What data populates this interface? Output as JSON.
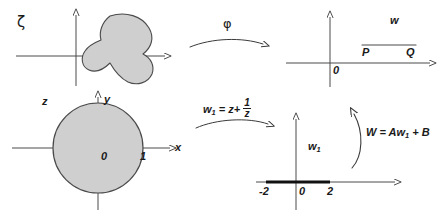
{
  "figure": {
    "width": 444,
    "height": 217,
    "background": "#ffffff",
    "ink": "#3a3a3a",
    "text_color": "#1a1a1a",
    "fill_gray": "#cfcfcf"
  },
  "panels": {
    "zeta_plane": {
      "plane_label": "ζ",
      "region_name": "blob-region",
      "origin": {
        "x": 76,
        "y": 56
      },
      "x_axis": {
        "x1": 16,
        "x2": 168,
        "y": 56
      },
      "y_axis": {
        "x": 76,
        "y1": 14,
        "y2": 88
      }
    },
    "w_plane": {
      "plane_label": "w",
      "origin_label": "0",
      "point_p_label": "P",
      "point_q_label": "Q",
      "segment": {
        "x1": 362,
        "x2": 416,
        "y": 45
      },
      "origin": {
        "x": 330,
        "y": 63
      },
      "x_axis": {
        "x1": 286,
        "x2": 432,
        "y": 63
      },
      "y_axis": {
        "x": 330,
        "y1": 16,
        "y2": 88
      }
    },
    "z_plane": {
      "plane_label": "z",
      "x_axis_label": "x",
      "y_axis_label": "y",
      "origin_label": "0",
      "unit_label": "1",
      "circle": {
        "cx": 98,
        "cy": 148,
        "r": 45
      },
      "origin": {
        "x": 98,
        "y": 148
      },
      "x_axis": {
        "x1": 12,
        "x2": 172,
        "y": 148
      },
      "y_axis": {
        "x": 98,
        "y1": 96,
        "y2": 212
      }
    },
    "w1_plane": {
      "plane_label": "w₁",
      "plane_label_base": "w",
      "plane_label_sub": "1",
      "origin_label": "0",
      "left_tick_label": "-2",
      "right_tick_label": "2",
      "cut_segment": {
        "x1": 266,
        "x2": 330,
        "y": 182
      },
      "origin": {
        "x": 296,
        "y": 182
      },
      "x_axis": {
        "x1": 256,
        "x2": 398,
        "y": 182
      },
      "y_axis": {
        "x": 296,
        "y1": 118,
        "y2": 212
      }
    }
  },
  "maps": {
    "phi": {
      "label": "φ",
      "arrow": "curved-right"
    },
    "joukowski": {
      "label_parts": {
        "lhs": "w",
        "lhs_sub": "1",
        "eq": "=",
        "rhs_first": "z",
        "plus": "+",
        "frac_num": "1",
        "frac_den": "z"
      },
      "label_plain": "w₁ = z + 1/z",
      "arrow": "curved-right"
    },
    "affine": {
      "label_parts": {
        "lhs": "W",
        "eq": "=",
        "a": "A",
        "w": "w",
        "w_sub": "1",
        "plus": "+",
        "b": "B"
      },
      "label_plain": "W = Aw₁ + B",
      "arrow": "curved-up"
    }
  }
}
